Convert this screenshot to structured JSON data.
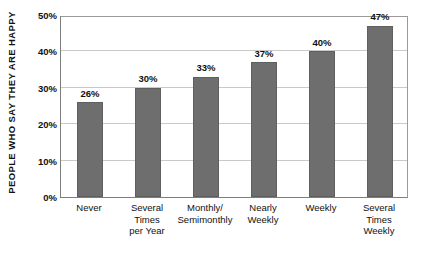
{
  "chart_data": {
    "type": "bar",
    "title": "",
    "xlabel": "",
    "ylabel": "PEOPLE WHO SAY THEY ARE HAPPY",
    "ylim": [
      0,
      50
    ],
    "yticks": [
      "0%",
      "10%",
      "20%",
      "30%",
      "40%",
      "50%"
    ],
    "ytick_values": [
      0,
      10,
      20,
      30,
      40,
      50
    ],
    "grid": true,
    "legend": "none",
    "bar_color": "#6e6e6e",
    "categories": [
      "Never",
      "Several Times per Year",
      "Monthly/ Semimonthly",
      "Nearly Weekly",
      "Weekly",
      "Several Times Weekly"
    ],
    "category_lines": [
      [
        "Never"
      ],
      [
        "Several",
        "Times",
        "per Year"
      ],
      [
        "Monthly/",
        "Semimonthly"
      ],
      [
        "Nearly",
        "Weekly"
      ],
      [
        "Weekly"
      ],
      [
        "Several",
        "Times",
        "Weekly"
      ]
    ],
    "values": [
      26,
      30,
      33,
      37,
      40,
      47
    ],
    "data_labels": [
      "26%",
      "30%",
      "33%",
      "37%",
      "40%",
      "47%"
    ]
  }
}
